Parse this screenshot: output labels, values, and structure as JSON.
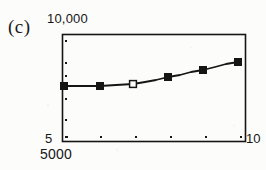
{
  "figure": {
    "panel_label": "(c)",
    "background_color": "#fcfcfa",
    "ink_color": "#151515"
  },
  "axes": {
    "y_top_label": "10,000",
    "y_bottom_label": "5",
    "x_left_label": "5000",
    "x_right_label": "10"
  },
  "chart_data": {
    "type": "line",
    "title": "(c)",
    "xlabel": "",
    "ylabel": "",
    "xscale": "log",
    "yscale": "log",
    "xlim": [
      5000,
      10
    ],
    "ylim": [
      5,
      10000
    ],
    "xticklabels": [
      "5000",
      "",
      "",
      "",
      "",
      "10"
    ],
    "yticklabels": [
      "10,000",
      "",
      "",
      "",
      "",
      "5"
    ],
    "grid": false,
    "legend": false,
    "frame": "box",
    "series": [
      {
        "name": "curve",
        "marker": "square",
        "line": "solid",
        "color": "#151515",
        "points": [
          {
            "px": 64,
            "py": 86,
            "marker": "filled"
          },
          {
            "px": 100,
            "py": 86,
            "marker": "filled"
          },
          {
            "px": 133,
            "py": 84,
            "marker": "open"
          },
          {
            "px": 168,
            "py": 77,
            "marker": "filled"
          },
          {
            "px": 203,
            "py": 70,
            "marker": "filled"
          },
          {
            "px": 238,
            "py": 62,
            "marker": "filled"
          }
        ],
        "path_px": [
          [
            64,
            86
          ],
          [
            82,
            86
          ],
          [
            100,
            86
          ],
          [
            116,
            85
          ],
          [
            133,
            84
          ],
          [
            145,
            82
          ],
          [
            156,
            80
          ],
          [
            168,
            77
          ],
          [
            180,
            75
          ],
          [
            191,
            72
          ],
          [
            203,
            70
          ],
          [
            215,
            67
          ],
          [
            226,
            64
          ],
          [
            238,
            62
          ]
        ]
      }
    ],
    "annotations": [
      {
        "text": "(c)",
        "role": "panel-label",
        "px": 8,
        "py": 16
      }
    ]
  },
  "plot_box_px": {
    "left": 62,
    "top": 34,
    "right": 245,
    "bottom": 141
  },
  "ticks": {
    "y_px": [
      40,
      62,
      75,
      86,
      98,
      119,
      136
    ],
    "x_px": [
      66,
      100,
      135,
      170,
      205,
      240
    ]
  }
}
